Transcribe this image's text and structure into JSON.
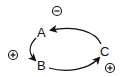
{
  "diagram": {
    "type": "causal-loop",
    "nodes": [
      {
        "id": "A",
        "label": "A"
      },
      {
        "id": "B",
        "label": "B"
      },
      {
        "id": "C",
        "label": "C"
      }
    ],
    "edges": [
      {
        "from": "A",
        "to": "B",
        "polarity": "+"
      },
      {
        "from": "B",
        "to": "C",
        "polarity": "+"
      },
      {
        "from": "C",
        "to": "A",
        "polarity": "-"
      }
    ],
    "loop_polarity_markers": [
      {
        "position": "top",
        "symbol": "minus-circle",
        "meaning": "negative"
      },
      {
        "position": "left",
        "symbol": "plus-circle",
        "meaning": "positive"
      },
      {
        "position": "bottom-right",
        "symbol": "plus-circle",
        "meaning": "positive"
      }
    ],
    "colors": {
      "stroke": "#111111",
      "background": "#ffffff"
    }
  }
}
